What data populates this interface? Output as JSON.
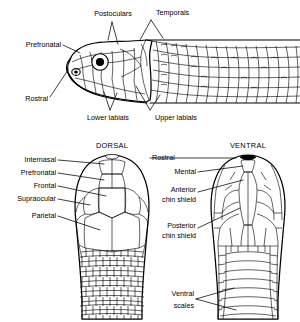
{
  "figure": {
    "line_color": "#000000",
    "background_color": "#ffffff"
  },
  "lateral_view": {
    "labels": [
      {
        "id": "postoculars",
        "text": "Postoculars"
      },
      {
        "id": "temporals",
        "text": "Temporals"
      },
      {
        "id": "prefronatal",
        "text": "Prefronatal"
      },
      {
        "id": "rostral",
        "text": "Rostral"
      },
      {
        "id": "lower-labials",
        "text": "Lower labials"
      },
      {
        "id": "upper-labials",
        "text": "Upper labials"
      }
    ]
  },
  "dorsal_view": {
    "heading": "DORSAL",
    "labels": [
      {
        "id": "internasal",
        "text": "Internasal"
      },
      {
        "id": "prefronatal",
        "text": "Prefronatal"
      },
      {
        "id": "frontal",
        "text": "Frontal"
      },
      {
        "id": "supraocular",
        "text": "Supraocular"
      },
      {
        "id": "parietal",
        "text": "Parietal"
      }
    ]
  },
  "ventral_view": {
    "heading": "VENTRAL",
    "labels": [
      {
        "id": "rostral",
        "text": "Rostral"
      },
      {
        "id": "mental",
        "text": "Mental"
      },
      {
        "id": "anterior-chin-shield",
        "line1": "Anterior",
        "line2": "chin shield"
      },
      {
        "id": "posterior-chin-shield",
        "line1": "Posterior",
        "line2": "chin shield"
      },
      {
        "id": "ventral-scales",
        "line1": "Ventral",
        "line2": "scales"
      }
    ]
  }
}
